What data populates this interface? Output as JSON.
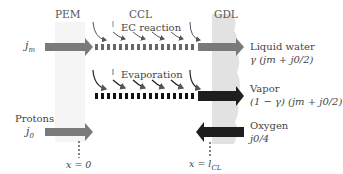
{
  "layers": {
    "pem": "PEM",
    "ccl": "CCL",
    "gdl": "GDL"
  },
  "processes": {
    "ec_reaction": "EC reaction",
    "evaporation": "Evaporation"
  },
  "inputs": {
    "membrane_flux": "j",
    "membrane_flux_sub": "m",
    "protons_label": "Protons",
    "protons_flux": "j",
    "protons_flux_sub": "0"
  },
  "outputs": {
    "liquid_label": "Liquid water",
    "liquid_expr": "γ (jm + j0/2)",
    "vapor_label": "Vapor",
    "vapor_expr": "(1 − γ) (jm + j0/2)",
    "oxygen_label": "Oxygen",
    "oxygen_expr": "j0/4"
  },
  "positions": {
    "x0": "x = 0",
    "xl": "x = l",
    "xl_sub": "CL"
  },
  "colors": {
    "gray_arrow": "#777777",
    "dark_arrow": "#222222",
    "gdl_band": "#e3e3e3",
    "pem_band": "#f4f4f4"
  }
}
